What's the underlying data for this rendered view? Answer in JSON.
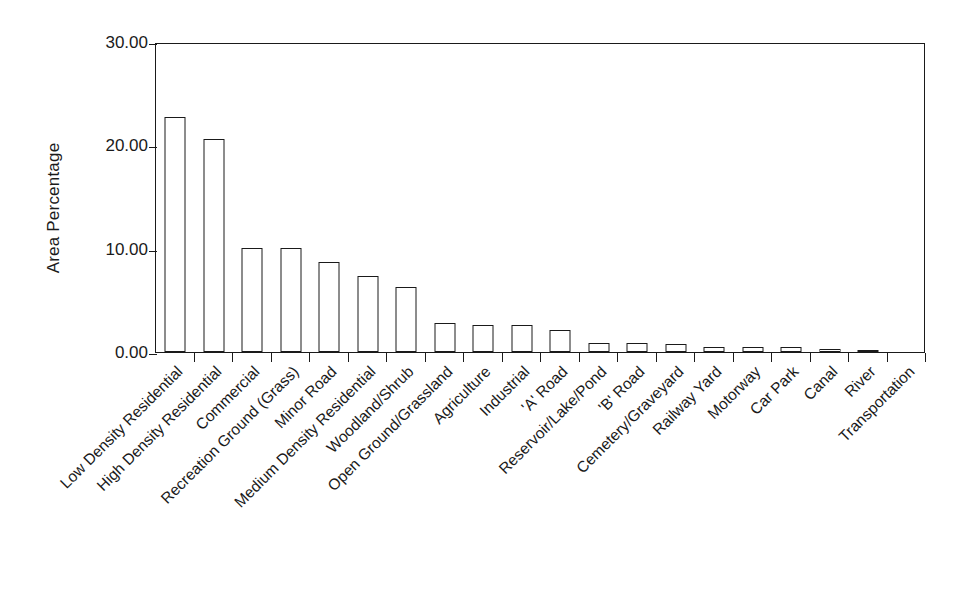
{
  "chart_data": {
    "type": "bar",
    "title": "",
    "xlabel": "",
    "ylabel": "Area Percentage",
    "ylim": [
      0,
      30
    ],
    "yticks": [
      "0.00",
      "10.00",
      "20.00",
      "30.00"
    ],
    "ytick_values": [
      0,
      10,
      20,
      30
    ],
    "grid": false,
    "legend": "none",
    "bar_style": "hollow-white-fill-black-outline",
    "categories": [
      "Low Density Residential",
      "High Density Residential",
      "Commercial",
      "Recreation Ground (Grass)",
      "Minor Road",
      "Medium Density Residential",
      "Woodland/Shrub",
      "Open Ground/Grassland",
      "Agriculture",
      "Industrial",
      "'A' Road",
      "Reservoir/Lake/Pond",
      "'B' Road",
      "Cemetery/Graveyard",
      "Railway Yard",
      "Motorway",
      "Car Park",
      "Canal",
      "River",
      "Transportation"
    ],
    "values": [
      22.7,
      20.6,
      10.1,
      10.1,
      8.7,
      7.4,
      6.3,
      2.8,
      2.6,
      2.6,
      2.1,
      0.9,
      0.85,
      0.75,
      0.45,
      0.45,
      0.45,
      0.25,
      0.05,
      0.0
    ]
  }
}
